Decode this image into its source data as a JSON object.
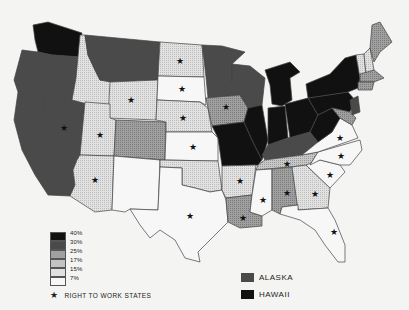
{
  "map": {
    "subject": "United States union membership by state",
    "categories": [
      {
        "label": "40%",
        "color": "#111111"
      },
      {
        "label": "30%",
        "color": "#4a4a4a"
      },
      {
        "label": "25%",
        "color": "#909090"
      },
      {
        "label": "17%",
        "color": "#b8b8b8"
      },
      {
        "label": "15%",
        "color": "#dcdcdc"
      },
      {
        "label": "7%",
        "color": "#f7f7f7"
      }
    ],
    "right_to_work_label": "RIGHT TO WORK STATES",
    "insets": [
      {
        "label": "ALASKA",
        "color": "#4a4a4a"
      },
      {
        "label": "HAWAII",
        "color": "#111111"
      }
    ],
    "states": [
      {
        "name": "WA",
        "level": "40%",
        "rtw": false
      },
      {
        "name": "OR",
        "level": "30%",
        "rtw": false
      },
      {
        "name": "CA",
        "level": "30%",
        "rtw": false
      },
      {
        "name": "NV",
        "level": "30%",
        "rtw": true
      },
      {
        "name": "ID",
        "level": "15%",
        "rtw": false
      },
      {
        "name": "MT",
        "level": "30%",
        "rtw": false
      },
      {
        "name": "WY",
        "level": "15%",
        "rtw": true
      },
      {
        "name": "UT",
        "level": "15%",
        "rtw": true
      },
      {
        "name": "AZ",
        "level": "15%",
        "rtw": true
      },
      {
        "name": "CO",
        "level": "25%",
        "rtw": false
      },
      {
        "name": "NM",
        "level": "7%",
        "rtw": false
      },
      {
        "name": "ND",
        "level": "15%",
        "rtw": true
      },
      {
        "name": "SD",
        "level": "7%",
        "rtw": true
      },
      {
        "name": "NE",
        "level": "15%",
        "rtw": true
      },
      {
        "name": "KS",
        "level": "7%",
        "rtw": true
      },
      {
        "name": "OK",
        "level": "15%",
        "rtw": false
      },
      {
        "name": "TX",
        "level": "7%",
        "rtw": true
      },
      {
        "name": "MN",
        "level": "30%",
        "rtw": false
      },
      {
        "name": "IA",
        "level": "25%",
        "rtw": true
      },
      {
        "name": "MO",
        "level": "40%",
        "rtw": false
      },
      {
        "name": "AR",
        "level": "15%",
        "rtw": true
      },
      {
        "name": "LA",
        "level": "25%",
        "rtw": true
      },
      {
        "name": "WI",
        "level": "30%",
        "rtw": false
      },
      {
        "name": "IL",
        "level": "40%",
        "rtw": false
      },
      {
        "name": "MI",
        "level": "40%",
        "rtw": false
      },
      {
        "name": "IN",
        "level": "40%",
        "rtw": false
      },
      {
        "name": "OH",
        "level": "40%",
        "rtw": false
      },
      {
        "name": "KY",
        "level": "30%",
        "rtw": false
      },
      {
        "name": "TN",
        "level": "17%",
        "rtw": true
      },
      {
        "name": "MS",
        "level": "7%",
        "rtw": true
      },
      {
        "name": "AL",
        "level": "25%",
        "rtw": true
      },
      {
        "name": "GA",
        "level": "15%",
        "rtw": true
      },
      {
        "name": "FL",
        "level": "7%",
        "rtw": true
      },
      {
        "name": "SC",
        "level": "7%",
        "rtw": true
      },
      {
        "name": "NC",
        "level": "7%",
        "rtw": true
      },
      {
        "name": "VA",
        "level": "7%",
        "rtw": true
      },
      {
        "name": "WV",
        "level": "40%",
        "rtw": false
      },
      {
        "name": "PA",
        "level": "40%",
        "rtw": false
      },
      {
        "name": "NY",
        "level": "40%",
        "rtw": false
      },
      {
        "name": "MD",
        "level": "25%",
        "rtw": false
      },
      {
        "name": "NJ",
        "level": "30%",
        "rtw": false
      },
      {
        "name": "ME",
        "level": "25%",
        "rtw": false
      },
      {
        "name": "VT",
        "level": "15%",
        "rtw": false
      },
      {
        "name": "NH",
        "level": "15%",
        "rtw": false
      },
      {
        "name": "MA",
        "level": "25%",
        "rtw": false
      },
      {
        "name": "CT",
        "level": "25%",
        "rtw": false
      }
    ]
  }
}
